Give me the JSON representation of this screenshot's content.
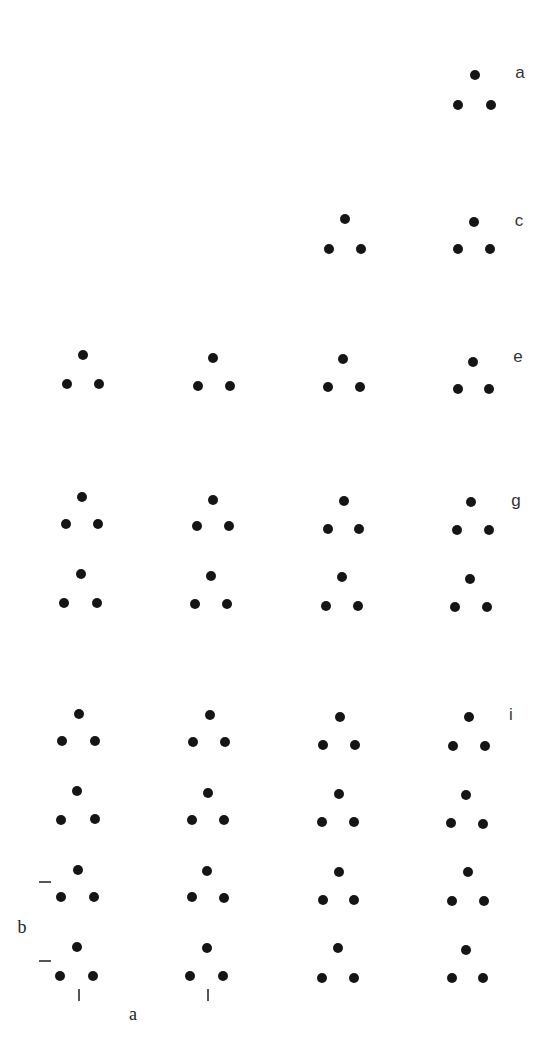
{
  "figure": {
    "dot_color": "#151515",
    "dot_diameter_px": 10,
    "panel_labels": [
      {
        "text": "a",
        "x": 520,
        "y": 72
      },
      {
        "text": "c",
        "x": 519,
        "y": 220
      },
      {
        "text": "e",
        "x": 518,
        "y": 356
      },
      {
        "text": "g",
        "x": 516,
        "y": 500
      },
      {
        "text": "i",
        "x": 511,
        "y": 714
      }
    ],
    "axis_labels": [
      {
        "text": "b",
        "x": 22,
        "y": 927
      },
      {
        "text": "a",
        "x": 133,
        "y": 1014
      }
    ],
    "dimension_marks": {
      "horizontal_dashes": [
        {
          "x": 39,
          "y": 881
        },
        {
          "x": 39,
          "y": 960
        }
      ],
      "vertical_ticks": [
        {
          "x": 78,
          "y": 989
        },
        {
          "x": 207,
          "y": 989
        }
      ]
    },
    "triangles": [
      {
        "row": "a",
        "col": 4,
        "dots": [
          [
            475,
            75
          ],
          [
            458,
            105
          ],
          [
            491,
            105
          ]
        ]
      },
      {
        "row": "c",
        "col": 3,
        "dots": [
          [
            345,
            219
          ],
          [
            329,
            249
          ],
          [
            361,
            249
          ]
        ]
      },
      {
        "row": "c",
        "col": 4,
        "dots": [
          [
            474,
            222
          ],
          [
            458,
            249
          ],
          [
            490,
            249
          ]
        ]
      },
      {
        "row": "e",
        "col": 1,
        "dots": [
          [
            83,
            355
          ],
          [
            67,
            384
          ],
          [
            99,
            384
          ]
        ]
      },
      {
        "row": "e",
        "col": 2,
        "dots": [
          [
            213,
            358
          ],
          [
            198,
            386
          ],
          [
            230,
            386
          ]
        ]
      },
      {
        "row": "e",
        "col": 3,
        "dots": [
          [
            343,
            359
          ],
          [
            328,
            387
          ],
          [
            360,
            387
          ]
        ]
      },
      {
        "row": "e",
        "col": 4,
        "dots": [
          [
            473,
            362
          ],
          [
            458,
            389
          ],
          [
            489,
            389
          ]
        ]
      },
      {
        "row": "g1",
        "col": 1,
        "dots": [
          [
            82,
            497
          ],
          [
            66,
            524
          ],
          [
            98,
            524
          ]
        ]
      },
      {
        "row": "g1",
        "col": 2,
        "dots": [
          [
            213,
            500
          ],
          [
            197,
            526
          ],
          [
            229,
            526
          ]
        ]
      },
      {
        "row": "g1",
        "col": 3,
        "dots": [
          [
            344,
            501
          ],
          [
            328,
            529
          ],
          [
            359,
            529
          ]
        ]
      },
      {
        "row": "g1",
        "col": 4,
        "dots": [
          [
            471,
            502
          ],
          [
            457,
            530
          ],
          [
            489,
            530
          ]
        ]
      },
      {
        "row": "g2",
        "col": 1,
        "dots": [
          [
            81,
            574
          ],
          [
            64,
            603
          ],
          [
            97,
            603
          ]
        ]
      },
      {
        "row": "g2",
        "col": 2,
        "dots": [
          [
            211,
            576
          ],
          [
            195,
            604
          ],
          [
            227,
            604
          ]
        ]
      },
      {
        "row": "g2",
        "col": 3,
        "dots": [
          [
            342,
            577
          ],
          [
            326,
            606
          ],
          [
            358,
            606
          ]
        ]
      },
      {
        "row": "g2",
        "col": 4,
        "dots": [
          [
            470,
            579
          ],
          [
            455,
            607
          ],
          [
            487,
            607
          ]
        ]
      },
      {
        "row": "i1",
        "col": 1,
        "dots": [
          [
            79,
            714
          ],
          [
            62,
            741
          ],
          [
            95,
            741
          ]
        ]
      },
      {
        "row": "i1",
        "col": 2,
        "dots": [
          [
            210,
            715
          ],
          [
            193,
            742
          ],
          [
            225,
            742
          ]
        ]
      },
      {
        "row": "i1",
        "col": 3,
        "dots": [
          [
            340,
            717
          ],
          [
            323,
            745
          ],
          [
            355,
            745
          ]
        ]
      },
      {
        "row": "i1",
        "col": 4,
        "dots": [
          [
            469,
            717
          ],
          [
            453,
            746
          ],
          [
            485,
            746
          ]
        ]
      },
      {
        "row": "i2",
        "col": 1,
        "dots": [
          [
            77,
            791
          ],
          [
            61,
            820
          ],
          [
            95,
            819
          ]
        ]
      },
      {
        "row": "i2",
        "col": 2,
        "dots": [
          [
            208,
            793
          ],
          [
            192,
            820
          ],
          [
            224,
            820
          ]
        ]
      },
      {
        "row": "i2",
        "col": 3,
        "dots": [
          [
            339,
            794
          ],
          [
            322,
            822
          ],
          [
            354,
            822
          ]
        ]
      },
      {
        "row": "i2",
        "col": 4,
        "dots": [
          [
            466,
            795
          ],
          [
            451,
            823
          ],
          [
            483,
            824
          ]
        ]
      },
      {
        "row": "i3",
        "col": 1,
        "dots": [
          [
            78,
            870
          ],
          [
            61,
            897
          ],
          [
            94,
            897
          ]
        ]
      },
      {
        "row": "i3",
        "col": 2,
        "dots": [
          [
            207,
            871
          ],
          [
            192,
            897
          ],
          [
            224,
            898
          ]
        ]
      },
      {
        "row": "i3",
        "col": 3,
        "dots": [
          [
            339,
            872
          ],
          [
            323,
            900
          ],
          [
            354,
            900
          ]
        ]
      },
      {
        "row": "i3",
        "col": 4,
        "dots": [
          [
            468,
            872
          ],
          [
            452,
            901
          ],
          [
            484,
            901
          ]
        ]
      },
      {
        "row": "i4",
        "col": 1,
        "dots": [
          [
            77,
            947
          ],
          [
            60,
            976
          ],
          [
            93,
            976
          ]
        ]
      },
      {
        "row": "i4",
        "col": 2,
        "dots": [
          [
            207,
            948
          ],
          [
            190,
            976
          ],
          [
            223,
            976
          ]
        ]
      },
      {
        "row": "i4",
        "col": 3,
        "dots": [
          [
            338,
            948
          ],
          [
            322,
            978
          ],
          [
            354,
            978
          ]
        ]
      },
      {
        "row": "i4",
        "col": 4,
        "dots": [
          [
            466,
            950
          ],
          [
            452,
            978
          ],
          [
            483,
            978
          ]
        ]
      }
    ]
  }
}
